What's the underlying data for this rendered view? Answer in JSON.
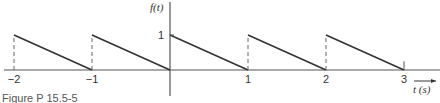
{
  "figure": {
    "caption": "Figure P 15.5-5"
  },
  "chart_data": {
    "type": "line",
    "title": "",
    "xlabel": "t (s)",
    "ylabel": "f(t)",
    "x_ticks": [
      -2,
      -1,
      1,
      2,
      3
    ],
    "x_tick_labels": [
      "−2",
      "−1",
      "1",
      "2",
      "3"
    ],
    "y_ticks": [
      1
    ],
    "y_tick_labels": [
      "1"
    ],
    "xlim": [
      -2.15,
      3.4
    ],
    "ylim": [
      -0.75,
      1.95
    ],
    "grid": false,
    "segments": [
      {
        "x": [
          -2,
          -1
        ],
        "y": [
          1,
          0
        ]
      },
      {
        "x": [
          -1,
          0
        ],
        "y": [
          1,
          0
        ]
      },
      {
        "x": [
          0,
          1
        ],
        "y": [
          1,
          0
        ]
      },
      {
        "x": [
          1,
          2
        ],
        "y": [
          1,
          0
        ]
      },
      {
        "x": [
          2,
          3
        ],
        "y": [
          1,
          0
        ]
      }
    ],
    "dashed_verticals": [
      {
        "x": -2,
        "y": [
          0,
          1
        ]
      },
      {
        "x": -1,
        "y": [
          0,
          1
        ]
      },
      {
        "x": 1,
        "y": [
          0,
          1
        ]
      },
      {
        "x": 2,
        "y": [
          0,
          1
        ]
      }
    ],
    "tick_at_end": {
      "x": 3,
      "height": 0.1
    }
  },
  "colors": {
    "line": "#333333",
    "axis": "#555555"
  }
}
